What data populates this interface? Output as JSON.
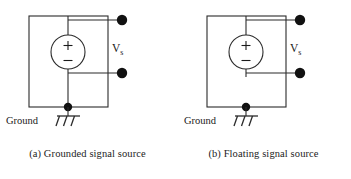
{
  "figure": {
    "background_color": "#ffffff",
    "line_color": "#2b2b2b",
    "terminal_color": "#111111"
  },
  "panels": [
    {
      "id": "grounded",
      "caption": "(a) Grounded signal source",
      "source_label": "V",
      "source_subscript": "s",
      "polarity_plus": "+",
      "polarity_minus": "−",
      "ground_label": "Ground",
      "ground_symbol": "chassis-ground",
      "terminals": 2
    },
    {
      "id": "floating",
      "caption": "(b) Floating signal source",
      "source_label": "V",
      "source_subscript": "s",
      "polarity_plus": "+",
      "polarity_minus": "−",
      "ground_label": "Ground",
      "ground_symbol": "chassis-ground",
      "terminals": 2
    }
  ]
}
